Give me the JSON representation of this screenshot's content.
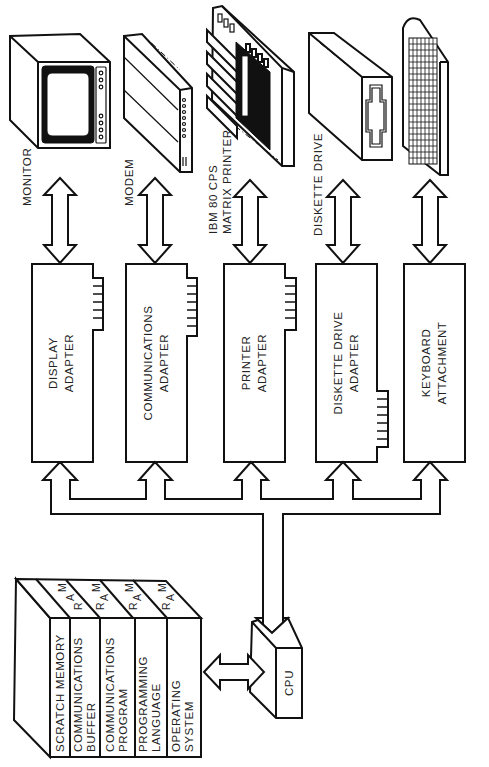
{
  "diagram": {
    "orientation": "rotated 90 degrees counter-clockwise",
    "devices": [
      {
        "id": "monitor",
        "label": "MONITOR"
      },
      {
        "id": "modem",
        "label": "MODEM"
      },
      {
        "id": "printer",
        "label_line1": "IBM 80 CPS",
        "label_line2": "MATRIX PRINTER"
      },
      {
        "id": "diskette",
        "label": "DISKETTE DRIVE"
      },
      {
        "id": "keyboard",
        "label": ""
      }
    ],
    "adapters": [
      {
        "id": "display",
        "line1": "DISPLAY",
        "line2": "ADAPTER"
      },
      {
        "id": "communications",
        "line1": "COMMUNICATIONS",
        "line2": "ADAPTER"
      },
      {
        "id": "printer",
        "line1": "PRINTER",
        "line2": "ADAPTER"
      },
      {
        "id": "diskette",
        "line1": "DISKETTE DRIVE",
        "line2": "ADAPTER"
      },
      {
        "id": "keyboard",
        "line1": "KEYBOARD",
        "line2": "ATTACHMENT"
      }
    ],
    "cpu": {
      "label": "CPU"
    },
    "ram": {
      "tab_label": [
        "R",
        "A",
        "M"
      ],
      "segments": [
        {
          "line1": "SCRATCH MEMORY",
          "line2": ""
        },
        {
          "line1": "COMMUNICATIONS",
          "line2": "BUFFER"
        },
        {
          "line1": "COMMUNICATIONS",
          "line2": "PROGRAM"
        },
        {
          "line1": "PROGRAMMING",
          "line2": "LANGUAGE"
        },
        {
          "line1": "OPERATING",
          "line2": "SYSTEM"
        }
      ]
    }
  }
}
